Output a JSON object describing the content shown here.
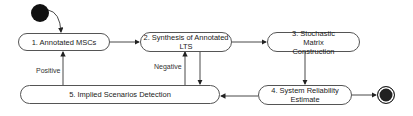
{
  "diagram": {
    "type": "activity-flow",
    "start_node": {
      "name": "initial-state"
    },
    "end_node": {
      "name": "final-state"
    },
    "nodes": [
      {
        "id": "n1",
        "label": "1. Annotated MSCs"
      },
      {
        "id": "n2",
        "label": "2. Synthesis of Annotated LTS"
      },
      {
        "id": "n3",
        "label": "3. Stochastic Matrix Construction"
      },
      {
        "id": "n4",
        "label": "4. System Reliability Estimate"
      },
      {
        "id": "n5",
        "label": "5. Implied Scenarios Detection"
      }
    ],
    "edges": [
      {
        "from": "start",
        "to": "n1",
        "label": ""
      },
      {
        "from": "n1",
        "to": "n2",
        "label": ""
      },
      {
        "from": "n2",
        "to": "n3",
        "label": ""
      },
      {
        "from": "n3",
        "to": "n4",
        "label": ""
      },
      {
        "from": "n4",
        "to": "n5",
        "label": ""
      },
      {
        "from": "n4",
        "to": "end",
        "label": ""
      },
      {
        "from": "n2",
        "to": "n5",
        "label": ""
      },
      {
        "from": "n5",
        "to": "n1",
        "label": "Positive"
      },
      {
        "from": "n5",
        "to": "n2",
        "label": "Negative"
      }
    ],
    "edge_labels": {
      "positive": "Positive",
      "negative": "Negative"
    },
    "colors": {
      "line": "#333333",
      "node_border": "#555555",
      "fill": "#ffffff",
      "terminal": "#111111"
    }
  }
}
